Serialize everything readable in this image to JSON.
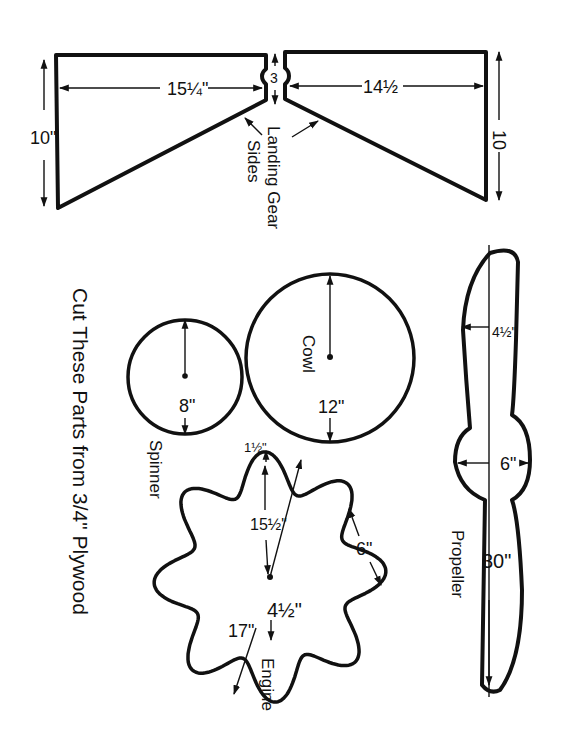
{
  "title": "Cut These Parts from 3/4\" Plywood",
  "parts": {
    "landing_gear": {
      "label_line1": "Landing Gear",
      "label_line2": "Sides",
      "left_width": "15¼\"",
      "left_height": "10\"",
      "notch_height": "3",
      "right_width": "14½",
      "right_height": "10"
    },
    "spinner": {
      "label": "Spinner",
      "diameter": "8\""
    },
    "cowl": {
      "label": "Cowl",
      "diameter": "12\""
    },
    "propeller": {
      "label": "Propeller",
      "blade_width": "4½\"",
      "hub_diameter": "6\"",
      "length": "30\""
    },
    "engine": {
      "label": "Engine",
      "lobe_depth": "1½\"",
      "inner_diameter": "15½\"",
      "center_offset": "4½\"",
      "outer_diameter": "17\"",
      "lobe_width": "6\""
    }
  },
  "colors": {
    "ink": "#111111",
    "paper": "#ffffff"
  }
}
